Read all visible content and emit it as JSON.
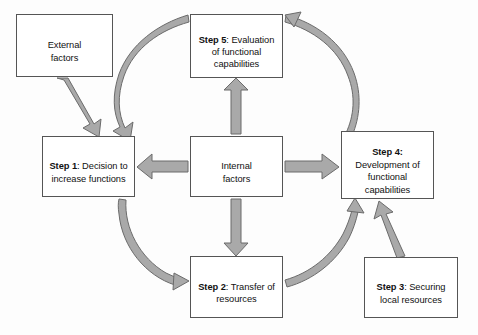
{
  "diagram": {
    "colors": {
      "arrow_fill": "#a9a9a9",
      "arrow_stroke": "#6b6b6b",
      "box_border": "#555555",
      "box_fill": "#ffffff",
      "text": "#111111",
      "background": "#fdfdfd"
    },
    "nodes": [
      {
        "id": "external-factors",
        "label_bold": "",
        "label": "External\nfactors",
        "bold_prefix": false
      },
      {
        "id": "step-5",
        "label_bold": "Step 5",
        "label": ": Evaluation\nof functional\ncapabilities",
        "bold_prefix": true
      },
      {
        "id": "step-1",
        "label_bold": "Step 1",
        "label": ": Decision to\nincrease functions",
        "bold_prefix": true
      },
      {
        "id": "internal-factors",
        "label_bold": "",
        "label": "Internal\nfactors",
        "bold_prefix": false
      },
      {
        "id": "step-4",
        "label_bold": "Step 4:",
        "label": "\nDevelopment of\nfunctional\ncapabilities",
        "bold_prefix": true
      },
      {
        "id": "step-2",
        "label_bold": "Step 2",
        "label": ": Transfer of\nresources",
        "bold_prefix": true
      },
      {
        "id": "step-3",
        "label_bold": "Step 3",
        "label": ": Securing\nlocal resources",
        "bold_prefix": true
      }
    ],
    "edges": [
      {
        "id": "external-to-step1",
        "from": "external-factors",
        "to": "step-1",
        "style": "straight-diagonal"
      },
      {
        "id": "step5-to-step1",
        "from": "step-5",
        "to": "step-1",
        "style": "curved"
      },
      {
        "id": "step1-to-step2",
        "from": "step-1",
        "to": "step-2",
        "style": "curved"
      },
      {
        "id": "step2-to-step4",
        "from": "step-2",
        "to": "step-4",
        "style": "curved"
      },
      {
        "id": "step4-to-step5",
        "from": "step-4",
        "to": "step-5",
        "style": "curved"
      },
      {
        "id": "step3-to-step4",
        "from": "step-3",
        "to": "step-4",
        "style": "straight-diagonal"
      },
      {
        "id": "internal-to-step5",
        "from": "internal-factors",
        "to": "step-5",
        "style": "straight-vertical"
      },
      {
        "id": "internal-to-step2",
        "from": "internal-factors",
        "to": "step-2",
        "style": "straight-vertical"
      },
      {
        "id": "internal-to-step1",
        "from": "internal-factors",
        "to": "step-1",
        "style": "straight-horizontal"
      },
      {
        "id": "internal-to-step4",
        "from": "internal-factors",
        "to": "step-4",
        "style": "straight-horizontal"
      }
    ]
  }
}
